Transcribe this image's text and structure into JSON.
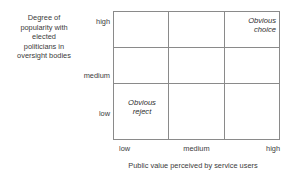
{
  "chart_data": {
    "type": "matrix",
    "title": "",
    "xlabel": "Public value perceived by service users",
    "ylabel": "Degree of popularity with elected politicians in oversight bodies",
    "x_ticks": [
      "low",
      "medium",
      "high"
    ],
    "y_ticks": [
      "low",
      "medium",
      "high"
    ],
    "grid": true,
    "rows": 3,
    "columns": 3,
    "annotations": [
      {
        "x": "high",
        "y": "high",
        "text": "Obvious choice",
        "style": "italic",
        "align": "right"
      },
      {
        "x": "low",
        "y": "low",
        "text": "Obvious reject",
        "style": "italic",
        "align": "center"
      }
    ],
    "colors": {
      "background": "#ffffff",
      "grid_line": "#8a8a8a",
      "text": "#3a3a3a"
    }
  },
  "axes": {
    "y": {
      "title_lines": [
        "Degree of",
        "popularity with",
        "elected",
        "politicians in",
        "oversight bodies"
      ],
      "ticks": {
        "high": "high",
        "medium": "medium",
        "low": "low"
      }
    },
    "x": {
      "title": "Public value perceived by service users",
      "ticks": {
        "low": "low",
        "medium": "medium",
        "high": "high"
      }
    }
  },
  "cells": {
    "obvious_choice": {
      "line1": "Obvious",
      "line2": "choice"
    },
    "obvious_reject": {
      "line1": "Obvious",
      "line2": "reject"
    }
  }
}
